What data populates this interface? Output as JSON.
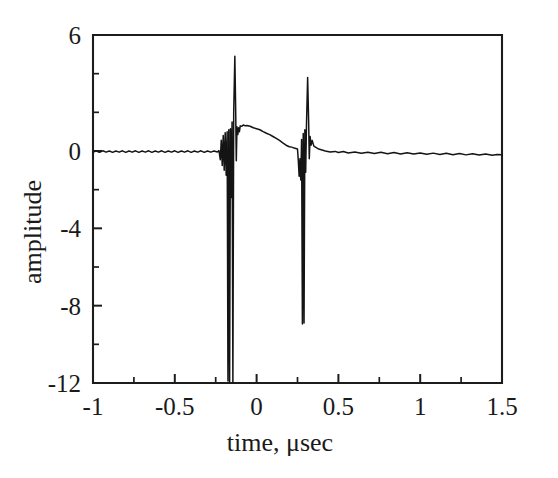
{
  "chart_data": {
    "type": "line",
    "title": "",
    "subtitle": "",
    "xlabel": "time, μsec",
    "ylabel": "amplitude",
    "xlim": [
      -1,
      1.5
    ],
    "ylim": [
      -12,
      6
    ],
    "grid": false,
    "legend": null,
    "xticks": [
      -1,
      -0.5,
      0,
      0.5,
      1,
      1.5
    ],
    "xticklabels": [
      "-1",
      "-0.5",
      "0",
      "0.5",
      "1",
      "1.5"
    ],
    "x_minor_ticks": [
      -0.75,
      -0.25,
      0.25,
      0.75,
      1.25
    ],
    "yticks": [
      6,
      0,
      -4,
      -8,
      -12
    ],
    "yticklabels": [
      "6",
      "0",
      "-4",
      "-8",
      "-12"
    ],
    "y_minor_ticks": [
      4,
      2,
      -2,
      -6,
      -10
    ],
    "line_color": "#141414",
    "background_color": "#ffffff",
    "annotations": [],
    "series": [
      {
        "name": "amplitude",
        "description": "Oscilloscope trace with two large bipolar transient spikes near t = -0.13 and t = 0.29 microseconds separated by a slowly decaying positive hump",
        "points": [
          [
            -1.0,
            -0.05
          ],
          [
            -0.98,
            0.0
          ],
          [
            -0.96,
            -0.07
          ],
          [
            -0.94,
            0.01
          ],
          [
            -0.92,
            -0.06
          ],
          [
            -0.9,
            0.0
          ],
          [
            -0.88,
            -0.07
          ],
          [
            -0.86,
            0.0
          ],
          [
            -0.84,
            -0.06
          ],
          [
            -0.82,
            0.01
          ],
          [
            -0.8,
            -0.07
          ],
          [
            -0.78,
            0.0
          ],
          [
            -0.76,
            -0.06
          ],
          [
            -0.74,
            0.01
          ],
          [
            -0.72,
            -0.07
          ],
          [
            -0.7,
            0.0
          ],
          [
            -0.68,
            -0.06
          ],
          [
            -0.66,
            0.01
          ],
          [
            -0.64,
            -0.07
          ],
          [
            -0.62,
            0.0
          ],
          [
            -0.6,
            -0.06
          ],
          [
            -0.58,
            0.01
          ],
          [
            -0.56,
            -0.07
          ],
          [
            -0.54,
            0.0
          ],
          [
            -0.52,
            -0.06
          ],
          [
            -0.5,
            0.01
          ],
          [
            -0.48,
            -0.07
          ],
          [
            -0.46,
            0.0
          ],
          [
            -0.44,
            -0.06
          ],
          [
            -0.42,
            0.01
          ],
          [
            -0.4,
            -0.07
          ],
          [
            -0.38,
            0.0
          ],
          [
            -0.36,
            -0.06
          ],
          [
            -0.34,
            0.01
          ],
          [
            -0.32,
            -0.07
          ],
          [
            -0.3,
            0.0
          ],
          [
            -0.28,
            -0.06
          ],
          [
            -0.26,
            0.0
          ],
          [
            -0.24,
            -0.05
          ],
          [
            -0.23,
            0.02
          ],
          [
            -0.222,
            -0.45
          ],
          [
            -0.216,
            0.55
          ],
          [
            -0.21,
            -0.75
          ],
          [
            -0.204,
            0.8
          ],
          [
            -0.198,
            -1.0
          ],
          [
            -0.192,
            0.95
          ],
          [
            -0.186,
            -1.25
          ],
          [
            -0.18,
            1.0
          ],
          [
            -0.175,
            -11.9
          ],
          [
            -0.17,
            1.1
          ],
          [
            -0.165,
            -11.95
          ],
          [
            -0.16,
            1.15
          ],
          [
            -0.155,
            -2.4
          ],
          [
            -0.15,
            1.5
          ],
          [
            -0.145,
            -12.0
          ],
          [
            -0.14,
            2.0
          ],
          [
            -0.133,
            4.9
          ],
          [
            -0.128,
            2.2
          ],
          [
            -0.124,
            -0.5
          ],
          [
            -0.12,
            1.25
          ],
          [
            -0.115,
            0.85
          ],
          [
            -0.11,
            1.2
          ],
          [
            -0.105,
            1.0
          ],
          [
            -0.1,
            1.3
          ],
          [
            -0.09,
            1.28
          ],
          [
            -0.08,
            1.35
          ],
          [
            -0.07,
            1.3
          ],
          [
            -0.06,
            1.32
          ],
          [
            -0.04,
            1.28
          ],
          [
            -0.02,
            1.2
          ],
          [
            0.0,
            1.15
          ],
          [
            0.02,
            1.1
          ],
          [
            0.04,
            1.0
          ],
          [
            0.06,
            0.92
          ],
          [
            0.08,
            0.85
          ],
          [
            0.1,
            0.75
          ],
          [
            0.12,
            0.65
          ],
          [
            0.14,
            0.55
          ],
          [
            0.16,
            0.42
          ],
          [
            0.18,
            0.3
          ],
          [
            0.2,
            0.22
          ],
          [
            0.215,
            0.2
          ],
          [
            0.23,
            0.15
          ],
          [
            0.24,
            0.13
          ],
          [
            0.25,
            0.1
          ],
          [
            0.255,
            -0.5
          ],
          [
            0.26,
            -1.3
          ],
          [
            0.265,
            -0.4
          ],
          [
            0.27,
            -1.5
          ],
          [
            0.275,
            0.6
          ],
          [
            0.28,
            -8.95
          ],
          [
            0.285,
            0.9
          ],
          [
            0.29,
            -8.9
          ],
          [
            0.295,
            1.1
          ],
          [
            0.3,
            -1.1
          ],
          [
            0.305,
            1.4
          ],
          [
            0.312,
            3.8
          ],
          [
            0.318,
            1.6
          ],
          [
            0.322,
            -0.4
          ],
          [
            0.327,
            0.75
          ],
          [
            0.333,
            0.3
          ],
          [
            0.34,
            0.55
          ],
          [
            0.35,
            0.25
          ],
          [
            0.36,
            0.2
          ],
          [
            0.38,
            0.1
          ],
          [
            0.4,
            0.05
          ],
          [
            0.42,
            0.0
          ],
          [
            0.45,
            -0.05
          ],
          [
            0.48,
            -0.02
          ],
          [
            0.5,
            -0.08
          ],
          [
            0.53,
            -0.03
          ],
          [
            0.56,
            -0.1
          ],
          [
            0.6,
            -0.05
          ],
          [
            0.64,
            -0.12
          ],
          [
            0.68,
            -0.06
          ],
          [
            0.72,
            -0.13
          ],
          [
            0.76,
            -0.07
          ],
          [
            0.8,
            -0.14
          ],
          [
            0.84,
            -0.08
          ],
          [
            0.88,
            -0.15
          ],
          [
            0.92,
            -0.09
          ],
          [
            0.96,
            -0.16
          ],
          [
            1.0,
            -0.1
          ],
          [
            1.04,
            -0.17
          ],
          [
            1.08,
            -0.11
          ],
          [
            1.12,
            -0.18
          ],
          [
            1.16,
            -0.12
          ],
          [
            1.2,
            -0.19
          ],
          [
            1.24,
            -0.13
          ],
          [
            1.28,
            -0.2
          ],
          [
            1.32,
            -0.14
          ],
          [
            1.36,
            -0.21
          ],
          [
            1.4,
            -0.15
          ],
          [
            1.44,
            -0.22
          ],
          [
            1.47,
            -0.18
          ],
          [
            1.5,
            -0.2
          ]
        ]
      }
    ]
  }
}
